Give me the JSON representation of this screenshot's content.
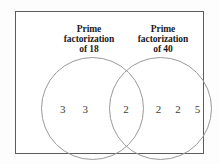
{
  "figure": {
    "type": "venn-diagram",
    "set_count": 2,
    "left_title": {
      "line1": "Prime",
      "line2": "factorization",
      "line3": "of 18"
    },
    "right_title": {
      "line1": "Prime",
      "line2": "factorization",
      "line3": "of 40"
    },
    "regions": {
      "left_only": [
        "3",
        "3"
      ],
      "intersection": [
        "2"
      ],
      "right_only": [
        "2",
        "2",
        "5"
      ]
    },
    "colors": {
      "frame_border": "#5c5c5c",
      "circle_stroke": "#9a9a9a",
      "title_text": "#1a1a1a",
      "number_text": "#3d3d3d",
      "background": "#ffffff"
    }
  }
}
